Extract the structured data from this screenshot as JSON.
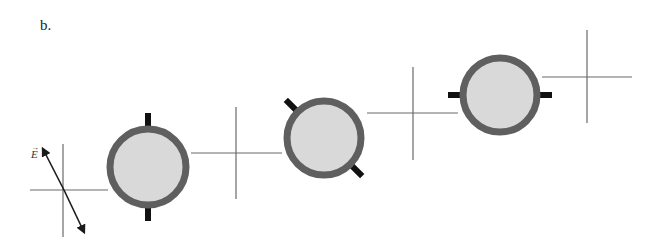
{
  "figure": {
    "panel_label": "b.",
    "field_vector_label": "E",
    "field_vector_arrow": "→",
    "colors": {
      "ring": "#5f5f5f",
      "disk_fill": "#d9d9d9",
      "tab": "#111111",
      "axis": "#6a6a6a",
      "arrow": "#1a1a1a"
    },
    "crosses": [
      {
        "cx": 63,
        "cy": 190,
        "h": [
          30,
          108
        ],
        "v": [
          144,
          237
        ]
      },
      {
        "cx": 236,
        "cy": 153,
        "h": [
          191,
          282
        ],
        "v": [
          107,
          199
        ]
      },
      {
        "cx": 413,
        "cy": 113,
        "h": [
          367,
          458
        ],
        "v": [
          67,
          160
        ]
      },
      {
        "cx": 587,
        "cy": 77,
        "h": [
          542,
          632
        ],
        "v": [
          30,
          123
        ]
      }
    ],
    "molecules": [
      {
        "cx": 148,
        "cy": 167,
        "r": 38,
        "tab_angle_deg": 90
      },
      {
        "cx": 324,
        "cy": 138,
        "r": 37,
        "tab_angle_deg": 135
      },
      {
        "cx": 500,
        "cy": 95,
        "r": 37,
        "tab_angle_deg": 0
      }
    ]
  }
}
